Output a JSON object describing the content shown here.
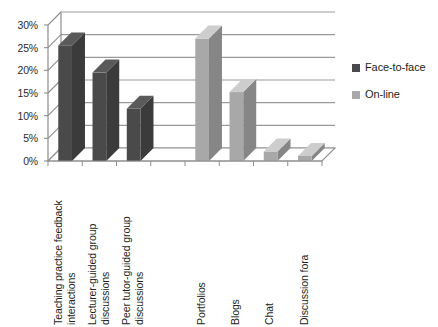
{
  "chart_data": {
    "type": "bar",
    "title": "",
    "xlabel": "",
    "ylabel": "",
    "ylim": [
      0,
      0.3
    ],
    "ytick_labels": [
      "30%",
      "25%",
      "20%",
      "15%",
      "10%",
      "5%",
      "0%"
    ],
    "ytick_values": [
      0.3,
      0.25,
      0.2,
      0.15,
      0.1,
      0.05,
      0.0
    ],
    "grid": true,
    "legend_position": "right",
    "categories": [
      "Teaching practice feedback\ninteractions",
      "Lecturer-guided group\ndiscussions",
      "Peer tutor-guided group\ndiscussions",
      "",
      "Portfolios",
      "Blogs",
      "Chat",
      "Discussion fora"
    ],
    "series": [
      {
        "name": "Face-to-face",
        "color": "#4a4a4a",
        "values": [
          0.255,
          0.195,
          0.115,
          null,
          null,
          null,
          null,
          null
        ]
      },
      {
        "name": "On-line",
        "color": "#a8a8a8",
        "values": [
          null,
          null,
          null,
          null,
          0.27,
          0.152,
          0.021,
          0.011
        ]
      }
    ]
  },
  "legend": {
    "items": [
      {
        "label": "Face-to-face",
        "color": "#4a4a4a"
      },
      {
        "label": "On-line",
        "color": "#a8a8a8"
      }
    ]
  },
  "axes": {
    "y_ticks": [
      "30%",
      "25%",
      "20%",
      "15%",
      "10%",
      "5%",
      "0%"
    ]
  },
  "style": {
    "background": "#ffffff",
    "axis_color": "#8d8d8d",
    "gridline_color": "#9a9a9a",
    "text_color": "#231f20"
  }
}
